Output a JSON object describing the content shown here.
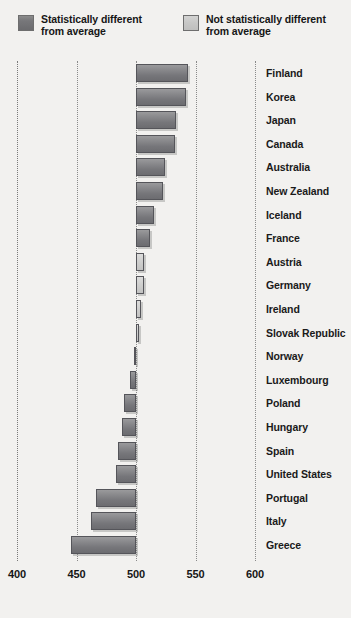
{
  "legend": {
    "items": [
      {
        "key": "statistically-different",
        "label": "Statistically different\nfrom average",
        "style": "dark",
        "color": "#77777a"
      },
      {
        "key": "not-statistically-different",
        "label": "Not statistically different\nfrom average",
        "style": "light",
        "color": "#c7c7c6"
      }
    ]
  },
  "chart_data": {
    "type": "bar",
    "orientation": "horizontal",
    "title": "",
    "subtitle": "",
    "xlabel": "",
    "ylabel": "",
    "xlim": [
      400,
      600
    ],
    "baseline": 500,
    "grid": true,
    "gridlines": [
      400,
      450,
      500,
      550,
      600
    ],
    "xticks": [
      "400",
      "450",
      "500",
      "550",
      "600"
    ],
    "legend_position": "top",
    "categories": [
      "Finland",
      "Korea",
      "Japan",
      "Canada",
      "Australia",
      "New Zealand",
      "Iceland",
      "France",
      "Austria",
      "Germany",
      "Ireland",
      "Slovak Republic",
      "Norway",
      "Luxembourg",
      "Poland",
      "Hungary",
      "Spain",
      "United States",
      "Portugal",
      "Italy",
      "Greece"
    ],
    "values": [
      544,
      542,
      534,
      533,
      524,
      523,
      515,
      512,
      507,
      507,
      504,
      502,
      498,
      495,
      490,
      488,
      485,
      483,
      466,
      462,
      445
    ],
    "significance": [
      "different",
      "different",
      "different",
      "different",
      "different",
      "different",
      "different",
      "different",
      "not-different",
      "not-different",
      "not-different",
      "not-different",
      "not-different",
      "different",
      "different",
      "different",
      "different",
      "different",
      "different",
      "different",
      "different"
    ]
  }
}
